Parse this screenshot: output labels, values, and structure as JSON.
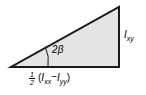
{
  "figure": {
    "name": "mohr-circle-angle-triangle",
    "background_color": "#ffffff",
    "shape": {
      "type": "right-triangle",
      "fill_color": "#e4e4e4",
      "stroke_color": "#1a1a1a",
      "stroke_width": 2,
      "vertices": [
        {
          "name": "bottom-left",
          "x": 11,
          "y": 67
        },
        {
          "name": "bottom-right",
          "x": 119,
          "y": 67
        },
        {
          "name": "apex",
          "x": 119,
          "y": 7
        }
      ]
    },
    "angle_arc": {
      "center": {
        "x": 11,
        "y": 67
      },
      "radius": 37,
      "stroke_color": "#1a1a1a",
      "stroke_width": 1
    },
    "labels": {
      "angle": "2β",
      "vertical_side": {
        "symbol": "I",
        "subscript": "xy",
        "text": "Ixy"
      },
      "base": {
        "fraction_numerator": "1",
        "fraction_denominator": "2",
        "open_paren": "(",
        "term1_symbol": "I",
        "term1_subscript": "xx",
        "operator": "−",
        "term2_symbol": "I",
        "term2_subscript": "yy",
        "close_paren": ")",
        "text": "1/2 (Ixx − Iyy)"
      }
    }
  }
}
